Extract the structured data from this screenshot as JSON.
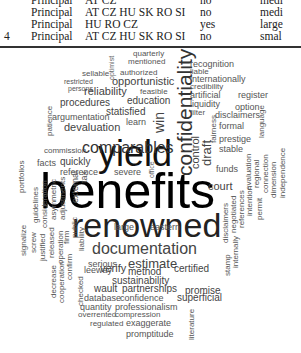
{
  "table": {
    "rows": [
      {
        "index": "",
        "role": "Principal",
        "countries": "AT CZ",
        "flag": "no",
        "size": "medi"
      },
      {
        "index": "",
        "role": "Principal",
        "countries": "AT CZ HU SK RO SI",
        "flag": "no",
        "size": "medi"
      },
      {
        "index": "",
        "role": "Principal",
        "countries": "HU RO CZ",
        "flag": "yes",
        "size": "large"
      },
      {
        "index": "4",
        "role": "Principal",
        "countries": "AT CZ HU SK RO SI",
        "flag": "no",
        "size": "smal"
      }
    ]
  },
  "word_cloud": {
    "words": [
      {
        "text": "benefits",
        "x": 40,
        "y": 118,
        "size": 50,
        "rot": 0,
        "color": "#000"
      },
      {
        "text": "yield",
        "x": 98,
        "y": 88,
        "size": 36,
        "rot": 0,
        "color": "#111"
      },
      {
        "text": "renowned",
        "x": 72,
        "y": 160,
        "size": 34,
        "rot": 0,
        "color": "#222"
      },
      {
        "text": "confidentiality",
        "x": 174,
        "y": 128,
        "size": 21,
        "rot": 1,
        "color": "#333"
      },
      {
        "text": "comparables",
        "x": 82,
        "y": 92,
        "size": 16,
        "rot": 0,
        "color": "#333"
      },
      {
        "text": "documentation",
        "x": 92,
        "y": 193,
        "size": 16,
        "rot": 0,
        "color": "#444"
      },
      {
        "text": "estimate",
        "x": 128,
        "y": 209,
        "size": 13,
        "rot": 0,
        "color": "#444"
      },
      {
        "text": "serious",
        "x": 88,
        "y": 212,
        "size": 9,
        "rot": 0,
        "color": "#555"
      },
      {
        "text": "control",
        "x": 190,
        "y": 121,
        "size": 11,
        "rot": 1,
        "color": "#444"
      },
      {
        "text": "draft",
        "x": 200,
        "y": 118,
        "size": 13,
        "rot": 1,
        "color": "#444"
      },
      {
        "text": "court",
        "x": 208,
        "y": 133,
        "size": 11,
        "rot": 0,
        "color": "#444"
      },
      {
        "text": "win",
        "x": 152,
        "y": 85,
        "size": 14,
        "rot": 1,
        "color": "#444"
      },
      {
        "text": "quarterly",
        "x": 133,
        "y": 2,
        "size": 8,
        "rot": 0,
        "color": "#555"
      },
      {
        "text": "mentioned",
        "x": 128,
        "y": 10,
        "size": 8,
        "rot": 0,
        "color": "#555"
      },
      {
        "text": "optimist",
        "x": 108,
        "y": 32,
        "size": 7,
        "rot": 1,
        "color": "#666"
      },
      {
        "text": "sellable",
        "x": 82,
        "y": 22,
        "size": 8,
        "rot": 0,
        "color": "#555"
      },
      {
        "text": "restricted",
        "x": 64,
        "y": 30,
        "size": 7,
        "rot": 0,
        "color": "#555"
      },
      {
        "text": "persons",
        "x": 68,
        "y": 37,
        "size": 7,
        "rot": 0,
        "color": "#555"
      },
      {
        "text": "authorized",
        "x": 120,
        "y": 21,
        "size": 8,
        "rot": 0,
        "color": "#555"
      },
      {
        "text": "opportunistic",
        "x": 112,
        "y": 28,
        "size": 11,
        "rot": 0,
        "color": "#444"
      },
      {
        "text": "reliability",
        "x": 84,
        "y": 38,
        "size": 11,
        "rot": 0,
        "color": "#444"
      },
      {
        "text": "feasible",
        "x": 140,
        "y": 40,
        "size": 8,
        "rot": 0,
        "color": "#555"
      },
      {
        "text": "procedures",
        "x": 60,
        "y": 50,
        "size": 10,
        "rot": 0,
        "color": "#444"
      },
      {
        "text": "education",
        "x": 127,
        "y": 48,
        "size": 10,
        "rot": 0,
        "color": "#444"
      },
      {
        "text": "statisfied",
        "x": 106,
        "y": 59,
        "size": 10,
        "rot": 0,
        "color": "#444"
      },
      {
        "text": "learn",
        "x": 126,
        "y": 70,
        "size": 9,
        "rot": 0,
        "color": "#555"
      },
      {
        "text": "argumentation",
        "x": 52,
        "y": 65,
        "size": 9,
        "rot": 0,
        "color": "#555"
      },
      {
        "text": "devaluation",
        "x": 64,
        "y": 74,
        "size": 11,
        "rot": 0,
        "color": "#444"
      },
      {
        "text": "commission",
        "x": 44,
        "y": 99,
        "size": 8,
        "rot": 0,
        "color": "#555"
      },
      {
        "text": "patience",
        "x": 46,
        "y": 88,
        "size": 8,
        "rot": 1,
        "color": "#555"
      },
      {
        "text": "facts",
        "x": 37,
        "y": 111,
        "size": 9,
        "rot": 0,
        "color": "#555"
      },
      {
        "text": "quickly",
        "x": 60,
        "y": 109,
        "size": 10,
        "rot": 0,
        "color": "#444"
      },
      {
        "text": "reference",
        "x": 60,
        "y": 120,
        "size": 9,
        "rot": 0,
        "color": "#555"
      },
      {
        "text": "portfolios",
        "x": 18,
        "y": 145,
        "size": 8,
        "rot": 1,
        "color": "#555"
      },
      {
        "text": "guidelines",
        "x": 32,
        "y": 175,
        "size": 8,
        "rot": 1,
        "color": "#555"
      },
      {
        "text": "consideration",
        "x": 41,
        "y": 180,
        "size": 8,
        "rot": 1,
        "color": "#555"
      },
      {
        "text": "asymmetric",
        "x": 50,
        "y": 172,
        "size": 8,
        "rot": 1,
        "color": "#555"
      },
      {
        "text": "adjustments",
        "x": 59,
        "y": 172,
        "size": 8,
        "rot": 1,
        "color": "#555"
      },
      {
        "text": "external",
        "x": 71,
        "y": 155,
        "size": 9,
        "rot": 1,
        "color": "#555"
      },
      {
        "text": "tax",
        "x": 80,
        "y": 135,
        "size": 9,
        "rot": 1,
        "color": "#555"
      },
      {
        "text": "signalize",
        "x": 20,
        "y": 208,
        "size": 8,
        "rot": 1,
        "color": "#555"
      },
      {
        "text": "screw",
        "x": 30,
        "y": 205,
        "size": 8,
        "rot": 1,
        "color": "#555"
      },
      {
        "text": "justified",
        "x": 39,
        "y": 213,
        "size": 8,
        "rot": 1,
        "color": "#555"
      },
      {
        "text": "released",
        "x": 48,
        "y": 210,
        "size": 8,
        "rot": 1,
        "color": "#555"
      },
      {
        "text": "operation",
        "x": 57,
        "y": 216,
        "size": 8,
        "rot": 1,
        "color": "#555"
      },
      {
        "text": "firm",
        "x": 63,
        "y": 196,
        "size": 8,
        "rot": 1,
        "color": "#555"
      },
      {
        "text": "public",
        "x": 71,
        "y": 190,
        "size": 8,
        "rot": 1,
        "color": "#555"
      },
      {
        "text": "liability",
        "x": 78,
        "y": 203,
        "size": 8,
        "rot": 1,
        "color": "#555"
      },
      {
        "text": "decrease",
        "x": 50,
        "y": 250,
        "size": 8,
        "rot": 1,
        "color": "#555"
      },
      {
        "text": "cooperation",
        "x": 58,
        "y": 255,
        "size": 8,
        "rot": 1,
        "color": "#555"
      },
      {
        "text": "confirm",
        "x": 66,
        "y": 232,
        "size": 8,
        "rot": 1,
        "color": "#555"
      },
      {
        "text": "checked",
        "x": 77,
        "y": 258,
        "size": 8,
        "rot": 1,
        "color": "#555"
      },
      {
        "text": "leeway",
        "x": 84,
        "y": 218,
        "size": 9,
        "rot": 0,
        "color": "#555"
      },
      {
        "text": "verify",
        "x": 100,
        "y": 215,
        "size": 11,
        "rot": 0,
        "color": "#444"
      },
      {
        "text": "method",
        "x": 128,
        "y": 219,
        "size": 10,
        "rot": 0,
        "color": "#444"
      },
      {
        "text": "certified",
        "x": 174,
        "y": 216,
        "size": 10,
        "rot": 0,
        "color": "#444"
      },
      {
        "text": "sustainability",
        "x": 112,
        "y": 228,
        "size": 10,
        "rot": 0,
        "color": "#444"
      },
      {
        "text": "wault",
        "x": 94,
        "y": 236,
        "size": 10,
        "rot": 0,
        "color": "#444"
      },
      {
        "text": "partnerships",
        "x": 122,
        "y": 236,
        "size": 10,
        "rot": 0,
        "color": "#444"
      },
      {
        "text": "promise",
        "x": 185,
        "y": 238,
        "size": 10,
        "rot": 0,
        "color": "#444"
      },
      {
        "text": "database",
        "x": 84,
        "y": 246,
        "size": 9,
        "rot": 0,
        "color": "#555"
      },
      {
        "text": "confidence",
        "x": 120,
        "y": 246,
        "size": 9,
        "rot": 0,
        "color": "#555"
      },
      {
        "text": "superficial",
        "x": 177,
        "y": 245,
        "size": 10,
        "rot": 0,
        "color": "#444"
      },
      {
        "text": "quantity",
        "x": 80,
        "y": 255,
        "size": 9,
        "rot": 0,
        "color": "#555"
      },
      {
        "text": "professionalism",
        "x": 115,
        "y": 255,
        "size": 9,
        "rot": 0,
        "color": "#555"
      },
      {
        "text": "overrented",
        "x": 78,
        "y": 263,
        "size": 8,
        "rot": 0,
        "color": "#555"
      },
      {
        "text": "compression",
        "x": 115,
        "y": 263,
        "size": 8,
        "rot": 0,
        "color": "#555"
      },
      {
        "text": "regulated",
        "x": 90,
        "y": 272,
        "size": 8,
        "rot": 0,
        "color": "#555"
      },
      {
        "text": "exaggerate",
        "x": 126,
        "y": 271,
        "size": 9,
        "rot": 0,
        "color": "#555"
      },
      {
        "text": "promptitude",
        "x": 126,
        "y": 282,
        "size": 9,
        "rot": 0,
        "color": "#555"
      },
      {
        "text": "literature",
        "x": 188,
        "y": 292,
        "size": 8,
        "rot": 1,
        "color": "#555"
      },
      {
        "text": "recognition",
        "x": 190,
        "y": 12,
        "size": 9,
        "rot": 0,
        "color": "#555"
      },
      {
        "text": "liable",
        "x": 190,
        "y": 20,
        "size": 8,
        "rot": 0,
        "color": "#555"
      },
      {
        "text": "internationally",
        "x": 190,
        "y": 27,
        "size": 9,
        "rot": 0,
        "color": "#555"
      },
      {
        "text": "credibility",
        "x": 190,
        "y": 35,
        "size": 8,
        "rot": 0,
        "color": "#555"
      },
      {
        "text": "artificial",
        "x": 190,
        "y": 43,
        "size": 9,
        "rot": 0,
        "color": "#555"
      },
      {
        "text": "register",
        "x": 238,
        "y": 43,
        "size": 9,
        "rot": 0,
        "color": "#555"
      },
      {
        "text": "liquidity",
        "x": 190,
        "y": 52,
        "size": 9,
        "rot": 0,
        "color": "#555"
      },
      {
        "text": "option",
        "x": 235,
        "y": 55,
        "size": 9,
        "rot": 0,
        "color": "#555"
      },
      {
        "text": "filter",
        "x": 190,
        "y": 61,
        "size": 8,
        "rot": 0,
        "color": "#555"
      },
      {
        "text": "disclaimers",
        "x": 215,
        "y": 63,
        "size": 9,
        "rot": 0,
        "color": "#555"
      },
      {
        "text": "formal",
        "x": 219,
        "y": 74,
        "size": 9,
        "rot": 0,
        "color": "#555"
      },
      {
        "text": "prestige",
        "x": 219,
        "y": 87,
        "size": 9,
        "rot": 0,
        "color": "#555"
      },
      {
        "text": "stable",
        "x": 219,
        "y": 97,
        "size": 9,
        "rot": 0,
        "color": "#555"
      },
      {
        "text": "fairness",
        "x": 210,
        "y": 95,
        "size": 8,
        "rot": 1,
        "color": "#555"
      },
      {
        "text": "language",
        "x": 258,
        "y": 90,
        "size": 8,
        "rot": 1,
        "color": "#555"
      },
      {
        "text": "funds",
        "x": 216,
        "y": 117,
        "size": 9,
        "rot": 0,
        "color": "#555"
      },
      {
        "text": "evaluation",
        "x": 245,
        "y": 142,
        "size": 8,
        "rot": 1,
        "color": "#555"
      },
      {
        "text": "regional",
        "x": 253,
        "y": 140,
        "size": 8,
        "rot": 1,
        "color": "#555"
      },
      {
        "text": "connection",
        "x": 262,
        "y": 145,
        "size": 8,
        "rot": 1,
        "color": "#555"
      },
      {
        "text": "dimension",
        "x": 270,
        "y": 150,
        "size": 8,
        "rot": 1,
        "color": "#555"
      },
      {
        "text": "independence",
        "x": 279,
        "y": 150,
        "size": 8,
        "rot": 1,
        "color": "#555"
      },
      {
        "text": "intention",
        "x": 246,
        "y": 168,
        "size": 8,
        "rot": 1,
        "color": "#555"
      },
      {
        "text": "references",
        "x": 238,
        "y": 180,
        "size": 8,
        "rot": 1,
        "color": "#555"
      },
      {
        "text": "permit",
        "x": 256,
        "y": 172,
        "size": 8,
        "rot": 1,
        "color": "#555"
      },
      {
        "text": "negotiated",
        "x": 230,
        "y": 185,
        "size": 8,
        "rot": 1,
        "color": "#555"
      },
      {
        "text": "disclaimers",
        "x": 222,
        "y": 195,
        "size": 8,
        "rot": 1,
        "color": "#555"
      },
      {
        "text": "internally",
        "x": 232,
        "y": 220,
        "size": 8,
        "rot": 1,
        "color": "#555"
      },
      {
        "text": "stamp",
        "x": 224,
        "y": 228,
        "size": 8,
        "rot": 1,
        "color": "#555"
      },
      {
        "text": "large",
        "x": 114,
        "y": 175,
        "size": 9,
        "rot": 0,
        "color": "#555"
      },
      {
        "text": "eastern",
        "x": 150,
        "y": 175,
        "size": 9,
        "rot": 0,
        "color": "#555"
      },
      {
        "text": "severe",
        "x": 114,
        "y": 120,
        "size": 9,
        "rot": 0,
        "color": "#555"
      },
      {
        "text": "office",
        "x": 148,
        "y": 130,
        "size": 7,
        "rot": 1,
        "color": "#666"
      }
    ]
  }
}
